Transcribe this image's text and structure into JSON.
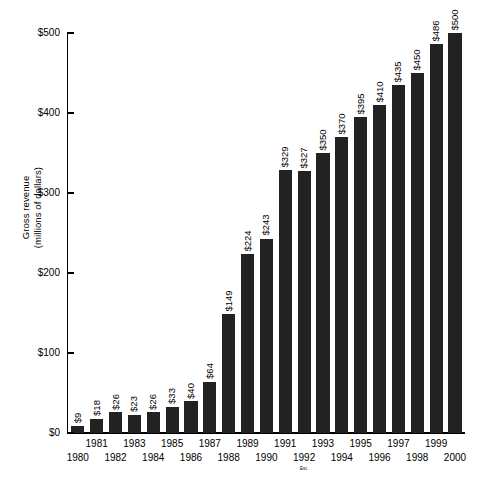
{
  "chart_data": {
    "type": "bar",
    "title": "",
    "xlabel": "",
    "ylabel": "Gross revenue (millions of dollars)",
    "ylabel_line1": "Gross revenue",
    "ylabel_line2": "(millions of dollars)",
    "ylim": [
      0,
      500
    ],
    "grid": false,
    "legend": "none",
    "y_ticks": [
      "$0",
      "$100",
      "$200",
      "$300",
      "$400",
      "$500"
    ],
    "y_tick_values": [
      0,
      100,
      200,
      300,
      400,
      500
    ],
    "categories": [
      "1980",
      "1981",
      "1982",
      "1983",
      "1984",
      "1985",
      "1986",
      "1987",
      "1988",
      "1989",
      "1990",
      "1991",
      "1992",
      "1993",
      "1994",
      "1995",
      "1996",
      "1997",
      "1998",
      "1999",
      "2000"
    ],
    "values": [
      9,
      18,
      26,
      23,
      26,
      33,
      40,
      64,
      149,
      224,
      243,
      329,
      327,
      350,
      370,
      395,
      410,
      435,
      450,
      486,
      500
    ],
    "data_labels": [
      "$9",
      "$18",
      "$26",
      "$23",
      "$26",
      "$33",
      "$40",
      "$64",
      "$149",
      "$224",
      "$243",
      "$329",
      "$327",
      "$350",
      "$370",
      "$395",
      "$410",
      "$435",
      "$450",
      "$486",
      "$500"
    ],
    "annotations": [
      {
        "text": "Est.",
        "category": "1992"
      }
    ],
    "bar_color": "#222222",
    "axis_color": "#000000",
    "background_color": "#ffffff"
  }
}
